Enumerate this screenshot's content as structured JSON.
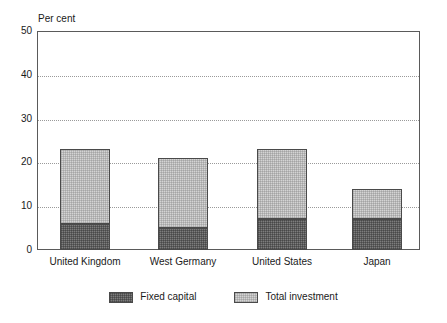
{
  "chart_data": {
    "type": "bar",
    "subtype": "stacked-bar",
    "title": "",
    "subtitle": "",
    "xlabel": "",
    "ylabel": "Per cent",
    "unit_label": "Per cent",
    "categories": [
      "United Kingdom",
      "West Germany",
      "United States",
      "Japan"
    ],
    "series": [
      {
        "name": "Fixed capital",
        "values": [
          6,
          5,
          7,
          7
        ],
        "color": "#7d7d7d"
      },
      {
        "name": "Total investment",
        "values": [
          23,
          21,
          23,
          14
        ],
        "color": "#d4d4d4"
      }
    ],
    "stack_note": "Total investment bars show the full stacked total; the Fixed capital segment is the dark lower portion of each bar.",
    "segment_values": {
      "fixed_capital": [
        6,
        5,
        7,
        7
      ],
      "remainder_to_total": [
        17,
        16,
        16,
        7
      ],
      "totals": [
        23,
        21,
        23,
        14
      ]
    },
    "ylim": [
      0,
      50
    ],
    "yticks": [
      0,
      10,
      20,
      30,
      40,
      50
    ],
    "ytick_labels": [
      "0",
      "10",
      "20",
      "30",
      "40",
      "50"
    ],
    "grid": true,
    "grid_style": "dotted-horizontal",
    "legend_position": "bottom-center",
    "legend": [
      "Fixed capital",
      "Total investment"
    ]
  },
  "legend": {
    "items": [
      {
        "label": "Fixed capital",
        "swatch": "dark-hatched"
      },
      {
        "label": "Total investment",
        "swatch": "light-hatched"
      }
    ]
  },
  "colors": {
    "fixed_capital": "#7d7d7d",
    "total_investment": "#d4d4d4",
    "frame": "#5a5a5a",
    "gridline": "#9a9a9a",
    "text": "#1a1a1a",
    "background": "#ffffff"
  }
}
